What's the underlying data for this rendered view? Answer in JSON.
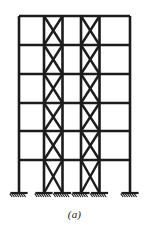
{
  "figure": {
    "kind": "structural-elevation-diagram",
    "caption": "(a)",
    "line_color": "#1c1c1c",
    "background_color": "#ffffff",
    "member_widths": {
      "column": 2.6,
      "beam": 2.6,
      "brace": 2.4,
      "ground_line": 2.2,
      "hatch": 1.1
    },
    "geometry": {
      "frame_left": 19,
      "frame_right": 130,
      "frame_top": 16,
      "frame_base": 193,
      "column_x": [
        19,
        44,
        62.5,
        81,
        99.5,
        130
      ],
      "floor_y": [
        16,
        45,
        74,
        103,
        131,
        160,
        193
      ],
      "story_count": 6,
      "bay_count": 5,
      "braced_bays": [
        1,
        3
      ],
      "support_count": 6
    },
    "supports": [
      {
        "name": "support-1",
        "x": 19,
        "y": 193,
        "type": "hatched-ground",
        "width": 15
      },
      {
        "name": "support-2",
        "x": 44,
        "y": 193,
        "type": "hatched-ground",
        "width": 15
      },
      {
        "name": "support-3",
        "x": 62.5,
        "y": 193,
        "type": "hatched-ground",
        "width": 15
      },
      {
        "name": "support-4",
        "x": 81,
        "y": 193,
        "type": "hatched-ground",
        "width": 15
      },
      {
        "name": "support-5",
        "x": 99.5,
        "y": 193,
        "type": "hatched-ground",
        "width": 15
      },
      {
        "name": "support-6",
        "x": 130,
        "y": 193,
        "type": "hatched-ground",
        "width": 15
      }
    ],
    "columns": [
      {
        "name": "column-A",
        "x": 19,
        "y_top": 16,
        "y_bottom": 193
      },
      {
        "name": "column-B",
        "x": 44,
        "y_top": 16,
        "y_bottom": 193
      },
      {
        "name": "column-C",
        "x": 62.5,
        "y_top": 16,
        "y_bottom": 193
      },
      {
        "name": "column-D",
        "x": 81,
        "y_top": 16,
        "y_bottom": 193
      },
      {
        "name": "column-E",
        "x": 99.5,
        "y_top": 16,
        "y_bottom": 193
      },
      {
        "name": "column-F",
        "x": 130,
        "y_top": 16,
        "y_bottom": 193
      }
    ],
    "beams": [
      {
        "name": "beam-roof",
        "y": 16,
        "x_left": 19,
        "x_right": 130,
        "level": 6
      },
      {
        "name": "beam-level-5",
        "y": 45,
        "x_left": 19,
        "x_right": 130,
        "level": 5
      },
      {
        "name": "beam-level-4",
        "y": 74,
        "x_left": 19,
        "x_right": 130,
        "level": 4
      },
      {
        "name": "beam-level-3",
        "y": 103,
        "x_left": 19,
        "x_right": 130,
        "level": 3
      },
      {
        "name": "beam-level-2",
        "y": 131,
        "x_left": 19,
        "x_right": 130,
        "level": 2
      },
      {
        "name": "beam-level-1",
        "y": 160,
        "x_left": 19,
        "x_right": 130,
        "level": 1
      }
    ],
    "braces": [
      {
        "name": "brace-bay2-story6",
        "bay": 2,
        "story": 6,
        "x1": 44,
        "y1": 16,
        "x2": 62.5,
        "y2": 45
      },
      {
        "name": "brace-bay2-story6-b",
        "bay": 2,
        "story": 6,
        "x1": 62.5,
        "y1": 16,
        "x2": 44,
        "y2": 45
      },
      {
        "name": "brace-bay4-story6",
        "bay": 4,
        "story": 6,
        "x1": 81,
        "y1": 16,
        "x2": 99.5,
        "y2": 45
      },
      {
        "name": "brace-bay4-story6-b",
        "bay": 4,
        "story": 6,
        "x1": 99.5,
        "y1": 16,
        "x2": 81,
        "y2": 45
      },
      {
        "name": "brace-bay2-story5",
        "bay": 2,
        "story": 5,
        "x1": 44,
        "y1": 45,
        "x2": 62.5,
        "y2": 74
      },
      {
        "name": "brace-bay2-story5-b",
        "bay": 2,
        "story": 5,
        "x1": 62.5,
        "y1": 45,
        "x2": 44,
        "y2": 74
      },
      {
        "name": "brace-bay4-story5",
        "bay": 4,
        "story": 5,
        "x1": 81,
        "y1": 45,
        "x2": 99.5,
        "y2": 74
      },
      {
        "name": "brace-bay4-story5-b",
        "bay": 4,
        "story": 5,
        "x1": 99.5,
        "y1": 45,
        "x2": 81,
        "y2": 74
      },
      {
        "name": "brace-bay2-story4",
        "bay": 2,
        "story": 4,
        "x1": 44,
        "y1": 74,
        "x2": 62.5,
        "y2": 103
      },
      {
        "name": "brace-bay2-story4-b",
        "bay": 2,
        "story": 4,
        "x1": 62.5,
        "y1": 74,
        "x2": 44,
        "y2": 103
      },
      {
        "name": "brace-bay4-story4",
        "bay": 4,
        "story": 4,
        "x1": 81,
        "y1": 74,
        "x2": 99.5,
        "y2": 103
      },
      {
        "name": "brace-bay4-story4-b",
        "bay": 4,
        "story": 4,
        "x1": 99.5,
        "y1": 74,
        "x2": 81,
        "y2": 103
      },
      {
        "name": "brace-bay2-story3",
        "bay": 2,
        "story": 3,
        "x1": 44,
        "y1": 103,
        "x2": 62.5,
        "y2": 131
      },
      {
        "name": "brace-bay2-story3-b",
        "bay": 2,
        "story": 3,
        "x1": 62.5,
        "y1": 103,
        "x2": 44,
        "y2": 131
      },
      {
        "name": "brace-bay4-story3",
        "bay": 4,
        "story": 3,
        "x1": 81,
        "y1": 103,
        "x2": 99.5,
        "y2": 131
      },
      {
        "name": "brace-bay4-story3-b",
        "bay": 4,
        "story": 3,
        "x1": 99.5,
        "y1": 103,
        "x2": 81,
        "y2": 131
      },
      {
        "name": "brace-bay2-story2",
        "bay": 2,
        "story": 2,
        "x1": 44,
        "y1": 131,
        "x2": 62.5,
        "y2": 160
      },
      {
        "name": "brace-bay2-story2-b",
        "bay": 2,
        "story": 2,
        "x1": 62.5,
        "y1": 131,
        "x2": 44,
        "y2": 160
      },
      {
        "name": "brace-bay4-story2",
        "bay": 4,
        "story": 2,
        "x1": 81,
        "y1": 131,
        "x2": 99.5,
        "y2": 160
      },
      {
        "name": "brace-bay4-story2-b",
        "bay": 4,
        "story": 2,
        "x1": 99.5,
        "y1": 131,
        "x2": 81,
        "y2": 160
      },
      {
        "name": "brace-bay2-story1",
        "bay": 2,
        "story": 1,
        "x1": 44,
        "y1": 160,
        "x2": 62.5,
        "y2": 193
      },
      {
        "name": "brace-bay2-story1-b",
        "bay": 2,
        "story": 1,
        "x1": 62.5,
        "y1": 160,
        "x2": 44,
        "y2": 193
      },
      {
        "name": "brace-bay4-story1",
        "bay": 4,
        "story": 1,
        "x1": 81,
        "y1": 160,
        "x2": 99.5,
        "y2": 193
      },
      {
        "name": "brace-bay4-story1-b",
        "bay": 4,
        "story": 1,
        "x1": 99.5,
        "y1": 160,
        "x2": 81,
        "y2": 193
      }
    ]
  }
}
